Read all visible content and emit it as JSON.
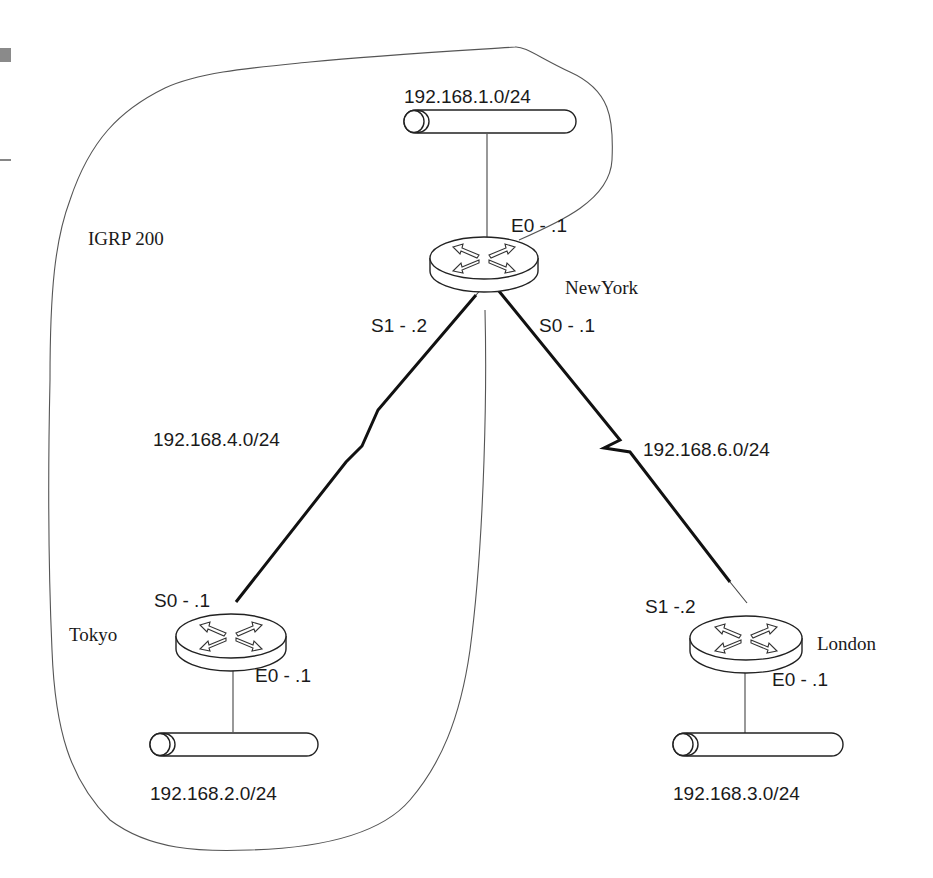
{
  "diagram": {
    "type": "network-topology",
    "routing_domain": {
      "label": "IGRP 200"
    },
    "routers": [
      {
        "name": "NewYork",
        "interfaces": {
          "E0": "E0 - .1",
          "S1": "S1 - .2",
          "S0": "S0 - .1"
        }
      },
      {
        "name": "Tokyo",
        "interfaces": {
          "S0": "S0 - .1",
          "E0": "E0 - .1"
        }
      },
      {
        "name": "London",
        "interfaces": {
          "S1": "S1 -.2",
          "E0": "E0 - .1"
        }
      }
    ],
    "lans": [
      {
        "network": "192.168.1.0/24",
        "attached_to": "NewYork"
      },
      {
        "network": "192.168.2.0/24",
        "attached_to": "Tokyo"
      },
      {
        "network": "192.168.3.0/24",
        "attached_to": "London"
      }
    ],
    "serial_links": [
      {
        "network": "192.168.4.0/24",
        "between": [
          "NewYork",
          "Tokyo"
        ]
      },
      {
        "network": "192.168.6.0/24",
        "between": [
          "NewYork",
          "London"
        ]
      }
    ]
  },
  "labels": {
    "igrp": "IGRP 200",
    "newyork": "NewYork",
    "tokyo": "Tokyo",
    "london": "London",
    "ny_e0": "E0 - .1",
    "ny_s1": "S1 - .2",
    "ny_s0": "S0 - .1",
    "tk_s0": "S0 - .1",
    "tk_e0": "E0 - .1",
    "ld_s1": "S1 -.2",
    "ld_e0": "E0 - .1",
    "net1": "192.168.1.0/24",
    "net2": "192.168.2.0/24",
    "net3": "192.168.3.0/24",
    "net4": "192.168.4.0/24",
    "net6": "192.168.6.0/24"
  },
  "colors": {
    "line": "#444444",
    "text": "#1a1a1a",
    "background": "#ffffff"
  }
}
